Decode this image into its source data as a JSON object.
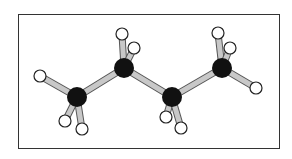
{
  "diagram": {
    "type": "ball-and-stick molecular model",
    "molecule": "butane",
    "colors": {
      "carbon": "#111111",
      "hydrogen": "#ffffff",
      "bond": "#c8c8c8",
      "frame": "#333333"
    },
    "atoms": [
      {
        "id": "C1",
        "el": "C",
        "x": 77,
        "y": 97
      },
      {
        "id": "C2",
        "el": "C",
        "x": 124,
        "y": 68
      },
      {
        "id": "C3",
        "el": "C",
        "x": 172,
        "y": 97
      },
      {
        "id": "C4",
        "el": "C",
        "x": 222,
        "y": 68
      },
      {
        "id": "H1",
        "el": "H",
        "x": 40,
        "y": 76
      },
      {
        "id": "H2",
        "el": "H",
        "x": 65,
        "y": 121
      },
      {
        "id": "H3",
        "el": "H",
        "x": 82,
        "y": 129
      },
      {
        "id": "H4",
        "el": "H",
        "x": 122,
        "y": 34
      },
      {
        "id": "H5",
        "el": "H",
        "x": 134,
        "y": 48
      },
      {
        "id": "H6",
        "el": "H",
        "x": 166,
        "y": 117
      },
      {
        "id": "H7",
        "el": "H",
        "x": 181,
        "y": 128
      },
      {
        "id": "H8",
        "el": "H",
        "x": 218,
        "y": 33
      },
      {
        "id": "H9",
        "el": "H",
        "x": 230,
        "y": 48
      },
      {
        "id": "H10",
        "el": "H",
        "x": 256,
        "y": 88
      }
    ],
    "bonds": [
      [
        "C1",
        "C2"
      ],
      [
        "C2",
        "C3"
      ],
      [
        "C3",
        "C4"
      ],
      [
        "C1",
        "H1"
      ],
      [
        "C1",
        "H2"
      ],
      [
        "C1",
        "H3"
      ],
      [
        "C2",
        "H4"
      ],
      [
        "C2",
        "H5"
      ],
      [
        "C3",
        "H6"
      ],
      [
        "C3",
        "H7"
      ],
      [
        "C4",
        "H8"
      ],
      [
        "C4",
        "H9"
      ],
      [
        "C4",
        "H10"
      ]
    ]
  }
}
